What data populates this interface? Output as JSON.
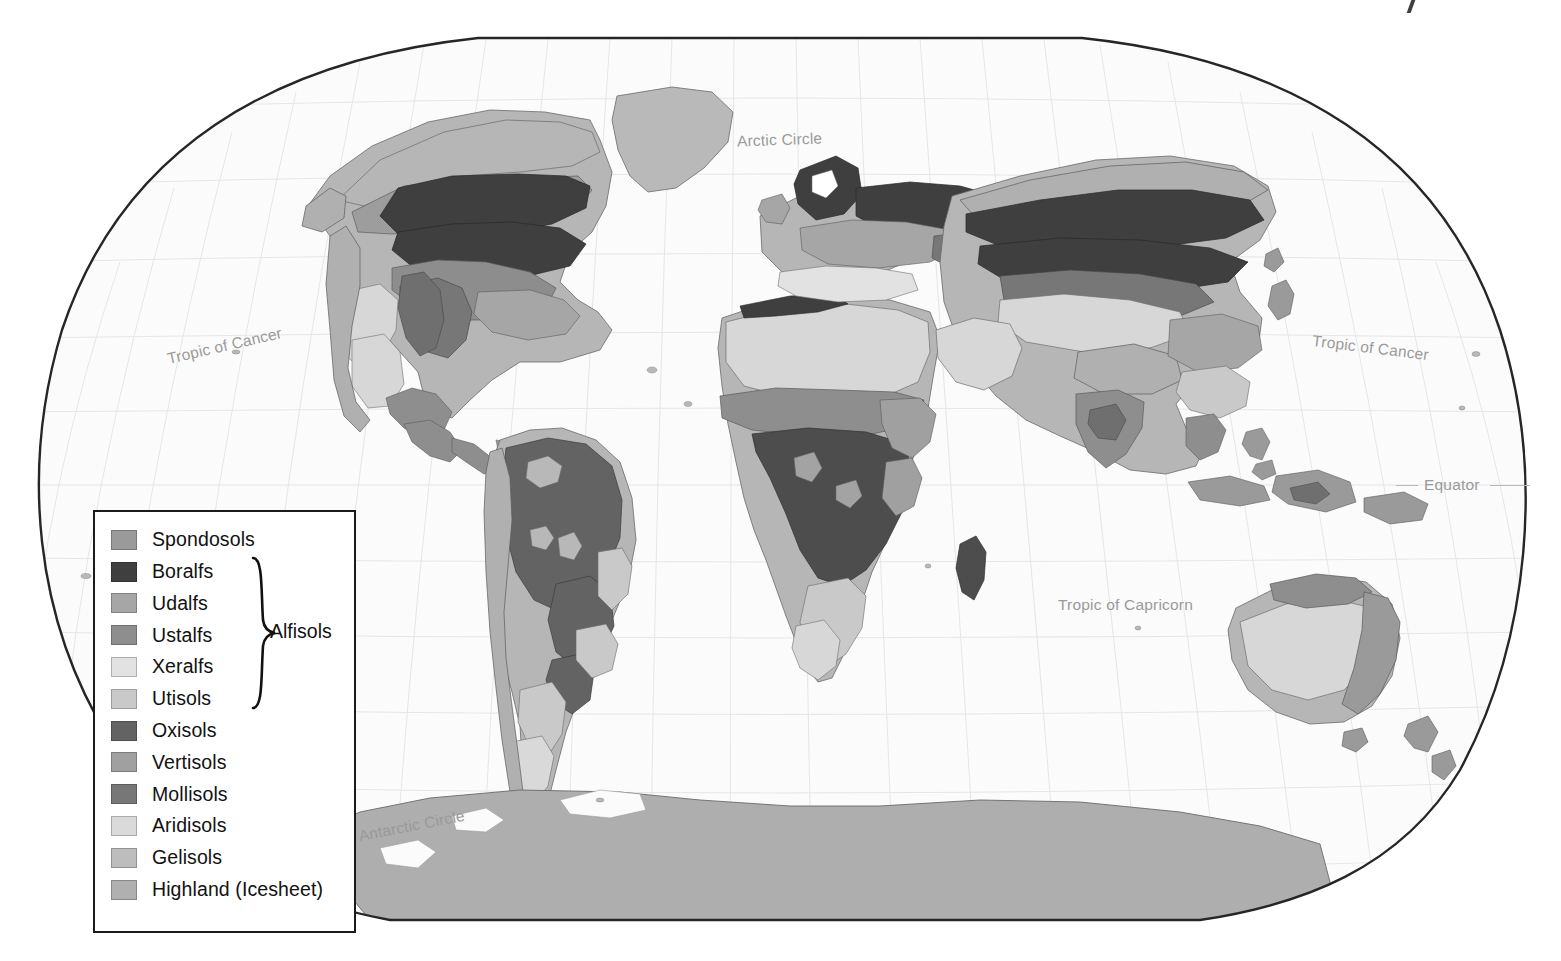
{
  "map": {
    "title": "World Soil Orders",
    "projection": "Winkel Tripel",
    "background_color": "#ffffff",
    "ocean_color": "#fbfbfb",
    "border_color": "#262626",
    "graticule_color": "#e4e4e4",
    "labels": [
      {
        "id": "arctic-circle",
        "text": "Arctic Circle",
        "x": 737,
        "y": 131,
        "rotate": -2
      },
      {
        "id": "tropic-cancer-w",
        "text": "Tropic of Cancer",
        "x": 166,
        "y": 337,
        "rotate": -13
      },
      {
        "id": "tropic-cancer-e",
        "text": "Tropic of Cancer",
        "x": 1312,
        "y": 339,
        "rotate": 7
      },
      {
        "id": "equator",
        "text": "Equator",
        "x": 1424,
        "y": 476,
        "rotate": 0
      },
      {
        "id": "tropic-capricorn",
        "text": "Tropic of Capricorn",
        "x": 1058,
        "y": 596,
        "rotate": 0
      },
      {
        "id": "antarctic-circle",
        "text": "Antarctic Circle",
        "x": 358,
        "y": 817,
        "rotate": -11
      }
    ]
  },
  "legend": {
    "group_label": "Alfisols",
    "group_member_indices": [
      1,
      2,
      3,
      4
    ],
    "items": [
      {
        "name": "Spondosols",
        "color": "#9a9a9a"
      },
      {
        "name": "Boralfs",
        "color": "#3f3f3f"
      },
      {
        "name": "Udalfs",
        "color": "#a6a6a6"
      },
      {
        "name": "Ustalfs",
        "color": "#8e8e8e"
      },
      {
        "name": "Xeralfs",
        "color": "#e2e2e2"
      },
      {
        "name": "Utisols",
        "color": "#c9c9c9"
      },
      {
        "name": "Oxisols",
        "color": "#636363"
      },
      {
        "name": "Vertisols",
        "color": "#a0a0a0"
      },
      {
        "name": "Mollisols",
        "color": "#777777"
      },
      {
        "name": "Aridisols",
        "color": "#dadada"
      },
      {
        "name": "Gelisols",
        "color": "#bdbdbd"
      },
      {
        "name": "Highland (Icesheet)",
        "color": "#b0b0b0"
      }
    ]
  },
  "chart_data": {
    "type": "map",
    "projection": "Winkel Tripel",
    "legend_entries": [
      "Spondosols",
      "Boralfs",
      "Udalfs",
      "Ustalfs",
      "Xeralfs",
      "Utisols",
      "Oxisols",
      "Vertisols",
      "Mollisols",
      "Aridisols",
      "Gelisols",
      "Highland (Icesheet)"
    ],
    "grouped_class": {
      "label": "Alfisols",
      "members": [
        "Boralfs",
        "Udalfs",
        "Ustalfs",
        "Xeralfs"
      ]
    },
    "reference_lines": [
      "Arctic Circle",
      "Tropic of Cancer",
      "Equator",
      "Tropic of Capricorn",
      "Antarctic Circle"
    ],
    "regions": [
      {
        "continent": "North America",
        "dominant": [
          "Boralfs",
          "Mollisols",
          "Udalfs",
          "Aridisols",
          "Spondosols",
          "Highland (Icesheet)"
        ]
      },
      {
        "continent": "South America",
        "dominant": [
          "Oxisols",
          "Utisols",
          "Aridisols",
          "Mollisols",
          "Highland (Icesheet)"
        ]
      },
      {
        "continent": "Africa",
        "dominant": [
          "Aridisols",
          "Oxisols",
          "Ustalfs",
          "Vertisols",
          "Utisols"
        ]
      },
      {
        "continent": "Europe",
        "dominant": [
          "Boralfs",
          "Udalfs",
          "Mollisols",
          "Xeralfs"
        ]
      },
      {
        "continent": "Asia",
        "dominant": [
          "Boralfs",
          "Gelisols",
          "Aridisols",
          "Mollisols",
          "Ustalfs",
          "Highland (Icesheet)"
        ]
      },
      {
        "continent": "Australia",
        "dominant": [
          "Aridisols",
          "Ustalfs",
          "Vertisols",
          "Utisols"
        ]
      },
      {
        "continent": "Antarctica",
        "dominant": [
          "Gelisols"
        ]
      },
      {
        "continent": "Greenland",
        "dominant": [
          "Gelisols"
        ]
      }
    ]
  }
}
